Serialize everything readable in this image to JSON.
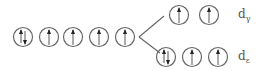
{
  "diagram": {
    "colors": {
      "stroke": "#666666",
      "background": "#ffffff"
    },
    "degenerate_set": {
      "orbitals": [
        {
          "cx": 23,
          "cy": 37,
          "electrons": "up-down"
        },
        {
          "cx": 49,
          "cy": 37,
          "electrons": "up"
        },
        {
          "cx": 73,
          "cy": 37,
          "electrons": "up"
        },
        {
          "cx": 99,
          "cy": 37,
          "electrons": "up"
        },
        {
          "cx": 125,
          "cy": 37,
          "electrons": "up"
        }
      ]
    },
    "upper_set": {
      "label_main": "d",
      "label_sub": "γ",
      "orbitals": [
        {
          "cx": 179,
          "cy": 15,
          "electrons": "up"
        },
        {
          "cx": 209,
          "cy": 15,
          "electrons": "up"
        }
      ]
    },
    "lower_set": {
      "label_main": "d",
      "label_sub": "ε",
      "orbitals": [
        {
          "cx": 166,
          "cy": 57,
          "electrons": "up-down"
        },
        {
          "cx": 192,
          "cy": 57,
          "electrons": "up"
        },
        {
          "cx": 218,
          "cy": 57,
          "electrons": "up"
        }
      ]
    },
    "split_lines": [
      {
        "x1": 139,
        "y1": 37,
        "x2": 164,
        "y2": 16
      },
      {
        "x1": 139,
        "y1": 37,
        "x2": 160,
        "y2": 53
      }
    ]
  }
}
